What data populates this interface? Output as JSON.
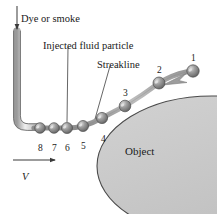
{
  "figure": {
    "background_color": "#ffffff",
    "line_color": "#5a5a5a",
    "ink_color": "#1a1a1a",
    "object_fill": "#c9c9c9",
    "object_stroke": "#4a4a4a",
    "particle_fill": "#8a8a8a",
    "particle_highlight": "#d8d8d8",
    "streakline_color": "#9a9a9a"
  },
  "annotations": {
    "dye_or_smoke": "Dye or smoke",
    "injected_fluid_particle": "Injected fluid particle",
    "streakline": "Streakline",
    "object": "Object",
    "velocity": "V"
  },
  "particles": [
    {
      "number": "1",
      "x": 193,
      "y": 71,
      "r": 6.2,
      "label_x": 191,
      "label_y": 54
    },
    {
      "number": "2",
      "x": 159,
      "y": 83,
      "r": 6.0,
      "label_x": 157,
      "label_y": 66
    },
    {
      "number": "3",
      "x": 125,
      "y": 106,
      "r": 5.8,
      "label_x": 123,
      "label_y": 89
    },
    {
      "number": "4",
      "x": 102,
      "y": 118,
      "r": 5.6,
      "label_x": 101,
      "label_y": 135
    },
    {
      "number": "5",
      "x": 83,
      "y": 126,
      "r": 5.5,
      "label_x": 81,
      "label_y": 142
    },
    {
      "number": "6",
      "x": 67,
      "y": 128,
      "r": 5.5,
      "label_x": 65,
      "label_y": 144
    },
    {
      "number": "7",
      "x": 54,
      "y": 128,
      "r": 5.3,
      "label_x": 52,
      "label_y": 144
    },
    {
      "number": "8",
      "x": 40,
      "y": 128,
      "r": 5.3,
      "label_x": 38,
      "label_y": 144
    }
  ],
  "label_positions": {
    "dye_or_smoke": {
      "x": 21,
      "y": 14
    },
    "injected_fluid_particle": {
      "x": 43,
      "y": 41
    },
    "streakline": {
      "x": 97,
      "y": 60
    },
    "object": {
      "x": 125,
      "y": 146
    },
    "velocity": {
      "x": 22,
      "y": 172
    }
  }
}
